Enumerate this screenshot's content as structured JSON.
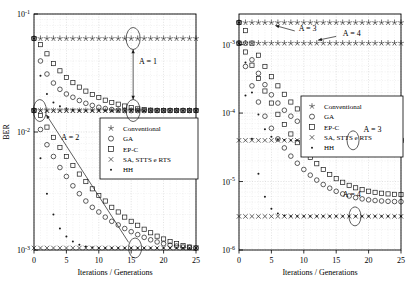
{
  "figure": {
    "panels": [
      {
        "id": "left",
        "xlabel": "Iterations / Generations",
        "ylabel": "BER",
        "xticks": [
          "0",
          "5",
          "10",
          "15",
          "20",
          "25"
        ],
        "xtickvals": [
          0,
          5,
          10,
          15,
          20,
          25
        ],
        "yticks": [
          "10^-1",
          "10^-2",
          "10^-3"
        ],
        "ytick_exponents": [
          "-1",
          "-2",
          "-3"
        ],
        "ylim_exp": [
          -3,
          -1
        ],
        "xlim": [
          0,
          25
        ],
        "annotations": [
          {
            "label": "A = 1",
            "x": 15.5,
            "y_exp": -1.42
          },
          {
            "label": "A = 2",
            "x": 7.0,
            "y_exp": -2.08
          }
        ],
        "legend": {
          "entries": [
            {
              "label": "Conventional",
              "marker": "star"
            },
            {
              "label": "GA",
              "marker": "circle"
            },
            {
              "label": "EP-C",
              "marker": "square"
            },
            {
              "label": "SA, STTS e RTS",
              "marker": "cross"
            },
            {
              "label": "HH",
              "marker": "dot"
            }
          ]
        }
      },
      {
        "id": "right",
        "xlabel": "Iterations / Generations",
        "ylabel": "",
        "xticks": [
          "0",
          "5",
          "10",
          "15",
          "20",
          "25"
        ],
        "xtickvals": [
          0,
          5,
          10,
          15,
          20,
          25
        ],
        "yticks": [
          "10^-3",
          "10^-4",
          "10^-5",
          "10^-6"
        ],
        "ytick_exponents": [
          "-3",
          "-4",
          "-5",
          "-6"
        ],
        "ylim_exp": [
          -6,
          -2.55
        ],
        "xlim": [
          0,
          25
        ],
        "annotations": [
          {
            "label": "A = 3",
            "x": 8.0,
            "y_exp": -2.8
          },
          {
            "label": "A = 4",
            "x": 16.0,
            "y_exp": -2.88
          },
          {
            "label": "A = 3",
            "x": 19.5,
            "y_exp": -4.62
          },
          {
            "label": "A = 4",
            "x": 18.0,
            "y_exp": -5.46
          }
        ],
        "legend": {
          "entries": [
            {
              "label": "Conventional",
              "marker": "star"
            },
            {
              "label": "GA",
              "marker": "circle"
            },
            {
              "label": "EP-C",
              "marker": "square"
            },
            {
              "label": "SA, STTS e RTS",
              "marker": "cross"
            },
            {
              "label": "HH",
              "marker": "dot"
            }
          ]
        }
      }
    ]
  },
  "chart_data": [
    {
      "type": "scatter",
      "panel": "left",
      "title": "",
      "xlabel": "Iterations / Generations",
      "ylabel": "BER",
      "xlim": [
        0,
        25
      ],
      "ylim": [
        0.001,
        0.1
      ],
      "yscale": "log",
      "grid": true,
      "legend_position": "center-right",
      "x": [
        0,
        1,
        2,
        3,
        4,
        5,
        6,
        7,
        8,
        9,
        10,
        11,
        12,
        13,
        14,
        15,
        16,
        17,
        18,
        19,
        20,
        21,
        22,
        23,
        24,
        25
      ],
      "series": [
        {
          "name": "Conventional (A = 1)",
          "marker": "star",
          "values": [
            0.062,
            0.062,
            0.062,
            0.062,
            0.062,
            0.062,
            0.062,
            0.062,
            0.062,
            0.062,
            0.062,
            0.062,
            0.062,
            0.062,
            0.062,
            0.062,
            0.062,
            0.062,
            0.062,
            0.062,
            0.062,
            0.062,
            0.062,
            0.062,
            0.062,
            0.062
          ]
        },
        {
          "name": "Conventional (A = 2)",
          "marker": "star",
          "values": [
            0.0152,
            0.0152,
            0.0152,
            0.0152,
            0.0152,
            0.0152,
            0.0152,
            0.0152,
            0.0152,
            0.0152,
            0.0152,
            0.0152,
            0.0152,
            0.0152,
            0.0152,
            0.0152,
            0.0152,
            0.0152,
            0.0152,
            0.0152,
            0.0152,
            0.0152,
            0.0152,
            0.0152,
            0.0152,
            0.0152
          ]
        },
        {
          "name": "GA (A = 1)",
          "marker": "circle",
          "values": [
            0.062,
            0.04,
            0.031,
            0.026,
            0.023,
            0.021,
            0.0197,
            0.0185,
            0.0175,
            0.0168,
            0.0162,
            0.0158,
            0.0155,
            0.0153,
            0.0152,
            0.0152,
            0.0152,
            0.0152,
            0.0152,
            0.0152,
            0.0152,
            0.0152,
            0.0152,
            0.0152,
            0.0152,
            0.0152
          ]
        },
        {
          "name": "GA (A = 2)",
          "marker": "circle",
          "values": [
            0.0152,
            0.0105,
            0.0078,
            0.0062,
            0.005,
            0.0042,
            0.0035,
            0.003,
            0.0026,
            0.0023,
            0.0021,
            0.0019,
            0.00175,
            0.00163,
            0.00152,
            0.00143,
            0.00135,
            0.00128,
            0.00122,
            0.00117,
            0.00113,
            0.0011,
            0.00108,
            0.00106,
            0.00105,
            0.00104
          ]
        },
        {
          "name": "EP-C (A = 1)",
          "marker": "square",
          "values": [
            0.062,
            0.055,
            0.046,
            0.038,
            0.033,
            0.029,
            0.0262,
            0.024,
            0.0222,
            0.0208,
            0.0196,
            0.0186,
            0.0178,
            0.0172,
            0.0166,
            0.0161,
            0.0157,
            0.0155,
            0.0153,
            0.0152,
            0.0152,
            0.0152,
            0.0152,
            0.0152,
            0.0152,
            0.0152
          ]
        },
        {
          "name": "EP-C (A = 2)",
          "marker": "square",
          "values": [
            0.0152,
            0.0138,
            0.011,
            0.009,
            0.0074,
            0.0062,
            0.0052,
            0.0044,
            0.0038,
            0.0033,
            0.0029,
            0.0026,
            0.0023,
            0.0021,
            0.0019,
            0.00175,
            0.00162,
            0.0015,
            0.0014,
            0.00131,
            0.00124,
            0.00118,
            0.00113,
            0.00109,
            0.00106,
            0.00104
          ]
        },
        {
          "name": "SA, STTS e RTS (A = 1)",
          "marker": "cross",
          "values": [
            0.0152,
            0.0152,
            0.0152,
            0.0152,
            0.0152,
            0.0152,
            0.0152,
            0.0152,
            0.0152,
            0.0152,
            0.0152,
            0.0152,
            0.0152,
            0.0152,
            0.0152,
            0.0152,
            0.0152,
            0.0152,
            0.0152,
            0.0152,
            0.0152,
            0.0152,
            0.0152,
            0.0152,
            0.0152,
            0.0152
          ]
        },
        {
          "name": "SA, STTS e RTS (A = 2)",
          "marker": "cross",
          "values": [
            0.00104,
            0.00104,
            0.00104,
            0.00104,
            0.00104,
            0.00104,
            0.00104,
            0.00104,
            0.00104,
            0.00104,
            0.00104,
            0.00104,
            0.00104,
            0.00104,
            0.00104,
            0.00104,
            0.00104,
            0.00104,
            0.00104,
            0.00104,
            0.00104,
            0.00104,
            0.00104,
            0.00104,
            0.00104,
            0.00104
          ]
        },
        {
          "name": "HH (A = 1)",
          "marker": "dot",
          "values": [
            0.062,
            0.03,
            0.021,
            0.0178,
            0.0165,
            0.0158,
            0.0154,
            0.0152,
            0.0152,
            0.0152,
            0.0152,
            0.0152,
            0.0152,
            0.0152,
            0.0152,
            0.0152,
            0.0152,
            0.0152,
            0.0152,
            0.0152,
            0.0152,
            0.0152,
            0.0152,
            0.0152,
            0.0152,
            0.0152
          ]
        },
        {
          "name": "HH (A = 2)",
          "marker": "dot",
          "values": [
            0.0152,
            0.006,
            0.003,
            0.002,
            0.00152,
            0.0013,
            0.00118,
            0.00111,
            0.00107,
            0.00105,
            0.00104,
            0.00104,
            0.00104,
            0.00104,
            0.00104,
            0.00104,
            0.00104,
            0.00104,
            0.00104,
            0.00104,
            0.00104,
            0.00104,
            0.00104,
            0.00104,
            0.00104,
            0.00104
          ]
        }
      ],
      "annotations": [
        "A = 1",
        "A = 2"
      ]
    },
    {
      "type": "scatter",
      "panel": "right",
      "title": "",
      "xlabel": "Iterations / Generations",
      "ylabel": "",
      "xlim": [
        0,
        25
      ],
      "ylim": [
        1e-06,
        0.0028
      ],
      "yscale": "log",
      "grid": true,
      "legend_position": "center-right",
      "x": [
        0,
        1,
        2,
        3,
        4,
        5,
        6,
        7,
        8,
        9,
        10,
        11,
        12,
        13,
        14,
        15,
        16,
        17,
        18,
        19,
        20,
        21,
        22,
        23,
        24,
        25
      ],
      "series": [
        {
          "name": "Conventional (A = 3)",
          "marker": "star",
          "values": [
            0.0021,
            0.0021,
            0.0021,
            0.0021,
            0.0021,
            0.0021,
            0.0021,
            0.0021,
            0.0021,
            0.0021,
            0.0021,
            0.0021,
            0.0021,
            0.0021,
            0.0021,
            0.0021,
            0.0021,
            0.0021,
            0.0021,
            0.0021,
            0.0021,
            0.0021,
            0.0021,
            0.0021,
            0.0021,
            0.0021
          ]
        },
        {
          "name": "Conventional (A = 4)",
          "marker": "star",
          "values": [
            0.00105,
            0.00105,
            0.00105,
            0.00105,
            0.00105,
            0.00105,
            0.00105,
            0.00105,
            0.00105,
            0.00105,
            0.00105,
            0.00105,
            0.00105,
            0.00105,
            0.00105,
            0.00105,
            0.00105,
            0.00105,
            0.00105,
            0.00105,
            0.00105,
            0.00105,
            0.00105,
            0.00105,
            0.00105,
            0.00105
          ]
        },
        {
          "name": "GA (A = 3)",
          "marker": "circle",
          "values": [
            0.0021,
            0.00105,
            0.0006,
            0.00038,
            0.00026,
            0.000185,
            0.00014,
            0.00011,
            9e-05,
            7.6e-05,
            6.6e-05,
            5.9e-05,
            5.35e-05,
            4.95e-05,
            4.65e-05,
            4.43e-05,
            4.28e-05,
            4.18e-05,
            4.12e-05,
            4.08e-05,
            4.05e-05,
            4.03e-05,
            4.02e-05,
            4.01e-05,
            4e-05,
            4e-05
          ]
        },
        {
          "name": "GA (A = 4)",
          "marker": "circle",
          "values": [
            0.00105,
            0.00048,
            0.00025,
            0.000145,
            9e-05,
            6e-05,
            4.2e-05,
            3.1e-05,
            2.35e-05,
            1.85e-05,
            1.5e-05,
            1.24e-05,
            1.05e-05,
            9.05e-06,
            8e-06,
            7.2e-06,
            6.6e-06,
            6.15e-06,
            5.82e-06,
            5.58e-06,
            5.4e-06,
            5.28e-06,
            5.2e-06,
            5.14e-06,
            5.1e-06,
            5.08e-06
          ]
        },
        {
          "name": "EP-C (A = 3)",
          "marker": "square",
          "values": [
            0.0021,
            0.0016,
            0.00105,
            0.0007,
            0.00048,
            0.00034,
            0.00025,
            0.000188,
            0.000145,
            0.000115,
            9.4e-05,
            7.85e-05,
            6.7e-05,
            5.85e-05,
            5.22e-05,
            4.75e-05,
            4.42e-05,
            4.2e-05,
            4.08e-05,
            4.03e-05,
            4.01e-05,
            4e-05,
            4e-05,
            4e-05,
            4e-05,
            4e-05
          ]
        },
        {
          "name": "EP-C (A = 4)",
          "marker": "square",
          "values": [
            0.00105,
            0.00078,
            0.0005,
            0.00032,
            0.00021,
            0.00014,
            9.6e-05,
            6.8e-05,
            4.95e-05,
            3.7e-05,
            2.85e-05,
            2.25e-05,
            1.82e-05,
            1.5e-05,
            1.27e-05,
            1.1e-05,
            9.75e-06,
            8.8e-06,
            8.1e-06,
            7.6e-06,
            7.22e-06,
            6.95e-06,
            6.75e-06,
            6.6e-06,
            6.5e-06,
            6.45e-06
          ]
        },
        {
          "name": "SA, STTS e RTS (A = 3)",
          "marker": "cross",
          "values": [
            4e-05,
            4e-05,
            4e-05,
            4e-05,
            4e-05,
            4e-05,
            4e-05,
            4e-05,
            4e-05,
            4e-05,
            4e-05,
            4e-05,
            4e-05,
            4e-05,
            4e-05,
            4e-05,
            4e-05,
            4e-05,
            4e-05,
            4e-05,
            4e-05,
            4e-05,
            4e-05,
            4e-05,
            4e-05,
            4e-05
          ]
        },
        {
          "name": "SA, STTS e RTS (A = 4)",
          "marker": "cross",
          "values": [
            3.1e-06,
            3.1e-06,
            3.1e-06,
            3.1e-06,
            3.1e-06,
            3.1e-06,
            3.1e-06,
            3.1e-06,
            3.1e-06,
            3.1e-06,
            3.1e-06,
            3.1e-06,
            3.1e-06,
            3.1e-06,
            3.1e-06,
            3.1e-06,
            3.1e-06,
            3.1e-06,
            3.1e-06,
            3.1e-06,
            3.1e-06,
            3.1e-06,
            3.1e-06,
            3.1e-06,
            3.1e-06,
            3.1e-06
          ]
        },
        {
          "name": "HH (A = 3)",
          "marker": "dot",
          "values": [
            0.0021,
            0.00055,
            0.0002,
            9.5e-05,
            5.8e-05,
            4.5e-05,
            4.15e-05,
            4.03e-05,
            4e-05,
            4e-05,
            4e-05,
            4e-05,
            4e-05,
            4e-05,
            4e-05,
            4e-05,
            4e-05,
            4e-05,
            4e-05,
            4e-05,
            4e-05,
            4e-05,
            4e-05,
            4e-05,
            4e-05,
            4e-05
          ]
        },
        {
          "name": "HH (A = 4)",
          "marker": "dot",
          "values": [
            0.00105,
            0.00018,
            4.2e-05,
            1.3e-05,
            6e-06,
            4e-06,
            3.4e-06,
            3.18e-06,
            3.12e-06,
            3.1e-06,
            3.1e-06,
            3.1e-06,
            3.1e-06,
            3.1e-06,
            3.1e-06,
            3.1e-06,
            3.1e-06,
            3.1e-06,
            3.1e-06,
            3.1e-06,
            3.1e-06,
            3.1e-06,
            3.1e-06,
            3.1e-06,
            3.1e-06,
            3.1e-06
          ]
        }
      ],
      "annotations": [
        "A = 3",
        "A = 4",
        "A = 3",
        "A = 4"
      ]
    }
  ],
  "colors": {
    "axis": "#000000",
    "grid": "#bfbfbf",
    "marker": "#1a1a1a",
    "background": "#ffffff"
  }
}
